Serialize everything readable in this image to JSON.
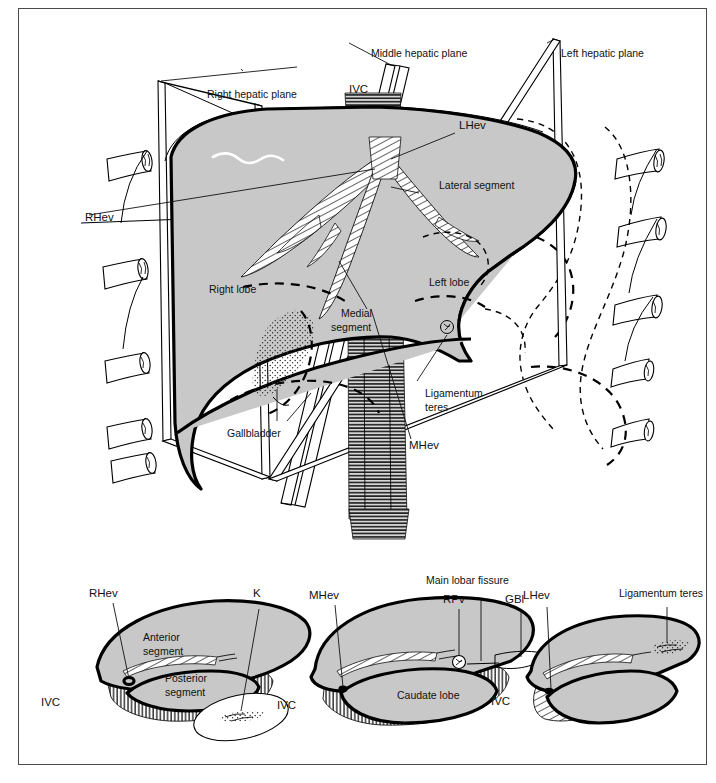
{
  "figure": {
    "title_visible": false,
    "panels": [
      "main-3d-liver",
      "right-lobe-sagittal",
      "mid-sagittal",
      "left-lobe-sagittal"
    ],
    "colors": {
      "organ_fill": "#c8c8c8",
      "outline": "#000000",
      "frame": "#4a4a4a",
      "background": "#ffffff"
    }
  },
  "main_panel": {
    "labels": {
      "right_hepatic_plane": "Right hepatic plane",
      "middle_hepatic_plane": "Middle hepatic plane",
      "left_hepatic_plane": "Left hepatic plane",
      "ivc": "IVC",
      "lhev": "LHev",
      "rhev": "RHev",
      "mhev": "MHev",
      "lateral_segment": "Lateral segment",
      "medial_segment_line1": "Medial",
      "medial_segment_line2": "segment",
      "right_lobe": "Right lobe",
      "left_lobe": "Left lobe",
      "gallbladder": "Gallbladder",
      "ligamentum_teres_line1": "Ligamentum",
      "ligamentum_teres_line2": "teres"
    }
  },
  "panel_right_lobe": {
    "labels": {
      "rhev": "RHev",
      "k": "K",
      "anterior_segment_line1": "Anterior",
      "anterior_segment_line2": "segment",
      "posterior_segment_line1": "Posterior",
      "posterior_segment_line2": "segment",
      "ivc": "IVC"
    }
  },
  "panel_mid": {
    "labels": {
      "mhev": "MHev",
      "main_lobar_fissure": "Main lobar fissure",
      "rpv": "RPv",
      "gbl": "GBl",
      "caudate_lobe": "Caudate lobe",
      "ivc": "IVC"
    }
  },
  "panel_left_lobe": {
    "labels": {
      "lhev": "LHev",
      "ligamentum_teres": "Ligamentum teres",
      "ivc": "IVC"
    }
  }
}
